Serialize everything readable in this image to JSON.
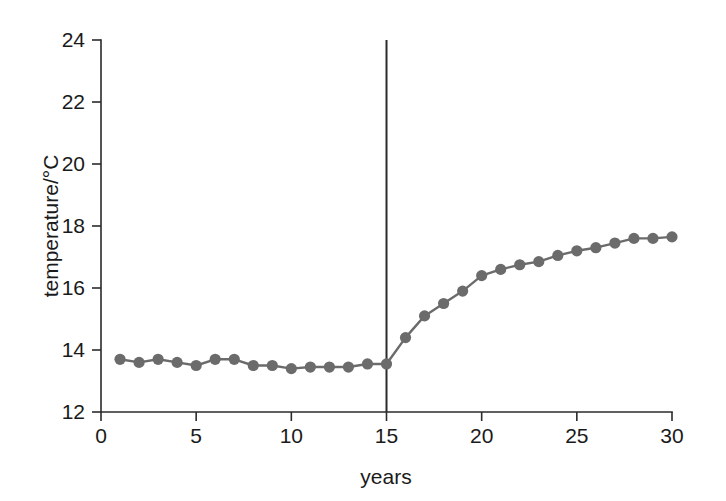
{
  "chart_data": {
    "type": "line",
    "title": "",
    "subtitle": "",
    "xlabel": "years",
    "ylabel": "temperature/°C",
    "xlim": [
      0,
      30
    ],
    "ylim": [
      12,
      24
    ],
    "xticks": [
      0,
      5,
      10,
      15,
      20,
      25,
      30
    ],
    "yticks": [
      12,
      14,
      16,
      18,
      20,
      22,
      24
    ],
    "xtick_labels": [
      "0",
      "5",
      "10",
      "15",
      "20",
      "25",
      "30"
    ],
    "ytick_labels": [
      "12",
      "14",
      "16",
      "18",
      "20",
      "22",
      "24"
    ],
    "grid": false,
    "legend": null,
    "legend_position": "none",
    "marker": "circle",
    "series_color": "#6b6b6b",
    "axis_color": "#2b2b2b",
    "x": [
      1,
      2,
      3,
      4,
      5,
      6,
      7,
      8,
      9,
      10,
      11,
      12,
      13,
      14,
      15,
      16,
      17,
      18,
      19,
      20,
      21,
      22,
      23,
      24,
      25,
      26,
      27,
      28,
      29,
      30
    ],
    "series": [
      {
        "name": "temperature",
        "color": "#6b6b6b",
        "values": [
          13.7,
          13.6,
          13.7,
          13.6,
          13.5,
          13.7,
          13.7,
          13.5,
          13.5,
          13.4,
          13.45,
          13.45,
          13.45,
          13.55,
          13.55,
          14.4,
          15.1,
          15.5,
          15.9,
          16.4,
          16.6,
          16.75,
          16.85,
          17.05,
          17.2,
          17.3,
          17.45,
          17.6,
          17.6,
          17.65
        ]
      }
    ],
    "annotations": [
      {
        "type": "vertical-line",
        "name": "event-marker-year-15",
        "x": 15,
        "y_from": 12,
        "y_to": 24,
        "color": "#2b2b2b",
        "label": ""
      }
    ]
  }
}
